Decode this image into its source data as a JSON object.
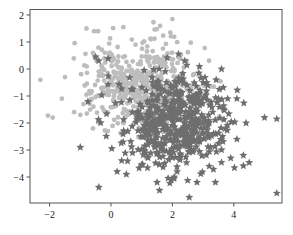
{
  "chart_data": {
    "type": "scatter",
    "title": "",
    "xlabel": "",
    "ylabel": "",
    "xlim": [
      -2.6,
      5.6
    ],
    "ylim": [
      -5.0,
      2.25
    ],
    "x_ticks": [
      -2,
      0,
      2,
      4
    ],
    "x_tick_labels": [
      "−2",
      "0",
      "2",
      "4"
    ],
    "y_ticks": [
      2,
      1,
      0,
      -1,
      -2,
      -3,
      -4
    ],
    "y_tick_labels": [
      "2",
      "1",
      "0",
      "−1",
      "−2",
      "−3",
      "−4"
    ],
    "grid": false,
    "legend": null,
    "series": [
      {
        "name": "class 0",
        "marker": "circle",
        "color": "#bdbdbd",
        "distribution": {
          "mean": [
            1.0,
            -0.6
          ],
          "std": [
            0.85,
            0.85
          ],
          "n": 500,
          "seed": 7
        },
        "points": [
          [
            -2.3,
            -0.4
          ],
          [
            -1.5,
            -0.3
          ],
          [
            -0.8,
            1.5
          ],
          [
            -0.55,
            1.4
          ],
          [
            0.4,
            1.55
          ],
          [
            -1.2,
            -1.6
          ],
          [
            -1.0,
            -1.7
          ],
          [
            -0.9,
            -1.3
          ],
          [
            -0.7,
            -0.9
          ],
          [
            -0.3,
            -0.2
          ],
          [
            2.0,
            1.85
          ],
          [
            1.6,
            1.6
          ],
          [
            0.8,
            0.9
          ],
          [
            1.3,
            1.1
          ],
          [
            -0.2,
            0.6
          ],
          [
            -1.6,
            -1.1
          ],
          [
            -1.9,
            -1.8
          ],
          [
            -0.1,
            -2.3
          ]
        ]
      },
      {
        "name": "class 1",
        "marker": "star",
        "color": "#6e6e6e",
        "distribution": {
          "mean": [
            2.0,
            -2.0
          ],
          "std": [
            0.9,
            0.9
          ],
          "n": 500,
          "seed": 13
        },
        "points": [
          [
            -0.4,
            0.3
          ],
          [
            -0.5,
            0.45
          ],
          [
            2.2,
            0.55
          ],
          [
            2.4,
            0.3
          ],
          [
            3.6,
            0.0
          ],
          [
            3.0,
            -0.5
          ],
          [
            3.5,
            -1.1
          ],
          [
            3.8,
            -1.1
          ],
          [
            4.1,
            -1.1
          ],
          [
            5.0,
            -1.8
          ],
          [
            5.4,
            -1.85
          ],
          [
            -1.0,
            -2.9
          ],
          [
            0.2,
            -3.8
          ],
          [
            0.5,
            -3.9
          ],
          [
            1.5,
            -4.2
          ],
          [
            2.8,
            -4.2
          ],
          [
            3.4,
            -4.2
          ],
          [
            5.4,
            -4.6
          ],
          [
            3.9,
            -3.3
          ],
          [
            4.1,
            -2.6
          ],
          [
            4.4,
            -2.0
          ],
          [
            3.2,
            -3.6
          ]
        ]
      }
    ]
  },
  "styles": {
    "axis_color": "#555555",
    "tick_label_color": "#222222"
  }
}
